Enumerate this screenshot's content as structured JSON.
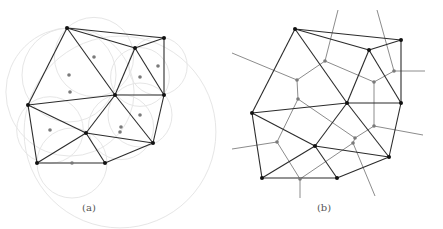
{
  "figure": {
    "panels": [
      {
        "id": "a",
        "caption": "(a)",
        "caption_pos": [
          89,
          209
        ],
        "description": "Delaunay triangulation with circumcircles and circumcenters",
        "sites": [
          [
            67,
            28
          ],
          [
            164,
            38
          ],
          [
            135,
            48
          ],
          [
            115,
            95
          ],
          [
            164,
            95
          ],
          [
            28,
            105
          ],
          [
            86,
            133
          ],
          [
            153,
            143
          ],
          [
            37,
            163
          ],
          [
            105,
            163
          ]
        ],
        "triangles": [
          [
            0,
            2,
            3
          ],
          [
            0,
            5,
            3
          ],
          [
            0,
            1,
            2
          ],
          [
            2,
            1,
            4
          ],
          [
            2,
            4,
            3
          ],
          [
            3,
            4,
            7
          ],
          [
            5,
            6,
            3
          ],
          [
            3,
            6,
            7
          ],
          [
            5,
            8,
            6
          ],
          [
            8,
            9,
            6
          ],
          [
            6,
            9,
            7
          ]
        ],
        "circumcenters": [
          [
            94,
            57
          ],
          [
            69,
            75
          ],
          [
            70,
            92
          ],
          [
            158,
            66
          ],
          [
            140,
            77
          ],
          [
            140,
            115
          ],
          [
            50,
            130
          ],
          [
            121,
            127
          ],
          [
            120,
            132
          ],
          [
            72,
            163
          ]
        ],
        "show_circles": true,
        "show_voronoi": false
      },
      {
        "id": "b",
        "caption": "(b)",
        "caption_pos": [
          324,
          209
        ],
        "description": "Delaunay triangulation with dual Voronoi diagram",
        "sites": [
          [
            295,
            29
          ],
          [
            401,
            40
          ],
          [
            369,
            50
          ],
          [
            347,
            103
          ],
          [
            401,
            103
          ],
          [
            252,
            113
          ],
          [
            315,
            146
          ],
          [
            389,
            157
          ],
          [
            262,
            178
          ],
          [
            337,
            178
          ]
        ],
        "triangles": [
          [
            0,
            2,
            3
          ],
          [
            0,
            5,
            3
          ],
          [
            0,
            1,
            2
          ],
          [
            2,
            1,
            4
          ],
          [
            2,
            4,
            3
          ],
          [
            3,
            4,
            7
          ],
          [
            5,
            6,
            3
          ],
          [
            3,
            6,
            7
          ],
          [
            5,
            8,
            6
          ],
          [
            8,
            9,
            6
          ],
          [
            6,
            9,
            7
          ]
        ],
        "voronoi_nodes": [
          [
            325,
            61
          ],
          [
            297,
            80
          ],
          [
            298,
            99
          ],
          [
            394,
            71
          ],
          [
            374,
            82
          ],
          [
            374,
            126
          ],
          [
            355,
            138
          ],
          [
            353,
            143
          ],
          [
            277,
            142
          ],
          [
            300,
            179
          ]
        ],
        "voronoi_edges": [
          [
            0,
            1
          ],
          [
            1,
            2
          ],
          [
            0,
            4
          ],
          [
            3,
            4
          ],
          [
            4,
            5
          ],
          [
            5,
            6
          ],
          [
            6,
            7
          ],
          [
            2,
            6
          ],
          [
            2,
            8
          ],
          [
            8,
            9
          ],
          [
            7,
            9
          ]
        ],
        "voronoi_rays": [
          [
            0,
            [
              338,
              10
            ]
          ],
          [
            3,
            [
              377,
              10
            ]
          ],
          [
            3,
            [
              425,
              71
            ]
          ],
          [
            1,
            [
              232,
              53
            ]
          ],
          [
            5,
            [
              423,
              135
            ]
          ],
          [
            7,
            [
              375,
              196
            ]
          ],
          [
            8,
            [
              232,
              149
            ]
          ],
          [
            9,
            [
              300,
              198
            ]
          ]
        ],
        "show_circles": false,
        "show_voronoi": true
      }
    ],
    "colors": {
      "edge": "#2b2b2b",
      "site": "#111111",
      "center": "#7a7a7a",
      "voronoi": "#8c8c8c",
      "circle": "#e6e6e6"
    }
  }
}
